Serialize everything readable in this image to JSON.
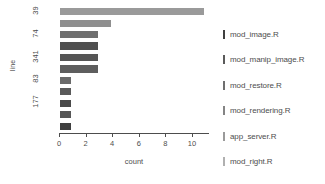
{
  "chart_data": {
    "type": "bar",
    "orientation": "horizontal",
    "title": "",
    "xlabel": "count",
    "ylabel": "line",
    "xlim": [
      0,
      11.2
    ],
    "xticks": [
      0,
      2,
      4,
      6,
      8,
      10
    ],
    "xticklabels": [
      "0",
      "2",
      "4",
      "6",
      "8",
      "10"
    ],
    "yticklabels": [
      "39",
      "74",
      "341",
      "83",
      "177"
    ],
    "grid": false,
    "legend_position": "right",
    "categories": [
      "39",
      "74",
      "341",
      "83",
      "177",
      "",
      "",
      "",
      "",
      "",
      ""
    ],
    "values": [
      11,
      4,
      3,
      3,
      3,
      3,
      1,
      1,
      1,
      1,
      1
    ],
    "bar_colors": [
      "#9a9a9a",
      "#8f8f8f",
      "#6f6f6f",
      "#4f4f4f",
      "#555555",
      "#5e5e5e",
      "#6a6a6a",
      "#5a5a5a",
      "#4a4a4a",
      "#565656",
      "#3f3f3f"
    ],
    "series": [
      {
        "name": "mod_image.R",
        "color": "#3f3f3f"
      },
      {
        "name": "mod_manip_image.R",
        "color": "#5a5a5a"
      },
      {
        "name": "mod_restore.R",
        "color": "#6f6f6f"
      },
      {
        "name": "mod_rendering.R",
        "color": "#848484"
      },
      {
        "name": "app_server.R",
        "color": "#9a9a9a"
      },
      {
        "name": "mod_right.R",
        "color": "#b0b0b0"
      }
    ]
  },
  "legend": {
    "items": [
      {
        "label": "mod_image.R",
        "color": "#3f3f3f"
      },
      {
        "label": "mod_manip_image.R",
        "color": "#5a5a5a"
      },
      {
        "label": "mod_restore.R",
        "color": "#6f6f6f"
      },
      {
        "label": "mod_rendering.R",
        "color": "#848484"
      },
      {
        "label": "app_server.R",
        "color": "#9a9a9a"
      },
      {
        "label": "mod_right.R",
        "color": "#b0b0b0"
      }
    ]
  },
  "axes": {
    "y_title": "line",
    "x_title": "count"
  },
  "colors": {
    "axis": "#4d4d4d",
    "background": "#ffffff"
  }
}
